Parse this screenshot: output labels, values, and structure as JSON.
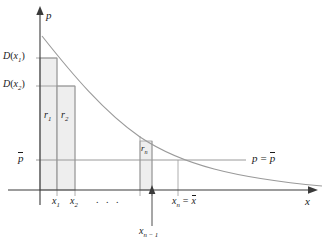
{
  "figure": {
    "type": "consumer-surplus-riemann-rectangles",
    "axes": {
      "y_axis_label": "p",
      "x_axis_label": "x",
      "y_axis_x_px": 40,
      "x_axis_y_px": 190
    },
    "y_ticks": [
      {
        "id": "D(x1)",
        "base": "D",
        "arg": "x",
        "sub": "1",
        "y_px": 58
      },
      {
        "id": "D(x2)",
        "base": "D",
        "arg": "x",
        "sub": "2",
        "y_px": 86
      },
      {
        "id": "pbar",
        "base": "p",
        "arg": "",
        "sub": "",
        "y_px": 160
      }
    ],
    "x_ticks": [
      {
        "id": "x1",
        "base": "x",
        "sub": "1",
        "x_px": 57
      },
      {
        "id": "x2",
        "base": "x",
        "sub": "2",
        "x_px": 75
      },
      {
        "id": "dots",
        "text": ". . .",
        "x_px": 104
      },
      {
        "id": "xn-1",
        "base": "x",
        "sub": "n − 1",
        "x_px": 152
      },
      {
        "id": "xn",
        "base": "x",
        "sub": "n",
        "x_px": 178
      }
    ],
    "labels": {
      "y_axis": "p",
      "x_axis": "x",
      "d_x1_base": "D",
      "d_x1_var": "x",
      "d_x1_sub": "1",
      "d_x2_base": "D",
      "d_x2_var": "x",
      "d_x2_sub": "2",
      "p_bar": "p",
      "r1_base": "r",
      "r1_sub": "1",
      "r2_base": "r",
      "r2_sub": "2",
      "rn_base": "r",
      "rn_sub": "n",
      "x1_base": "x",
      "x1_sub": "1",
      "x2_base": "x",
      "x2_sub": "2",
      "ellipsis": ". . .",
      "xn_minus_1_base": "x",
      "xn_minus_1_sub": "n − 1",
      "xn_base": "x",
      "xn_sub": "n",
      "xn_equals": "=",
      "xn_xbar": "x",
      "p_eq_left": "p",
      "p_eq_sign": "=",
      "p_eq_right": "p"
    },
    "rectangles": [
      {
        "name": "r1",
        "x_px": 40,
        "w_px": 17,
        "top_y_px": 58,
        "bottom_y_px": 190
      },
      {
        "name": "r2",
        "x_px": 57,
        "w_px": 18,
        "top_y_px": 86,
        "bottom_y_px": 190
      },
      {
        "name": "rn",
        "x_px": 140,
        "w_px": 12,
        "top_y_px": 141,
        "bottom_y_px": 190
      }
    ],
    "colors": {
      "curve": "#9a9a9a",
      "rect_fill": "#eeeeee",
      "rect_stroke": "#9a9a9a",
      "axis": "#3a3a3a",
      "guide": "#9a9a9a",
      "text": "#1a1a1a",
      "background": "#ffffff"
    },
    "curve": {
      "description": "decreasing convex demand curve D(x)",
      "path": "M 42,36 C 70,70 100,108 140,136 C 180,163 230,177 322,185"
    }
  }
}
